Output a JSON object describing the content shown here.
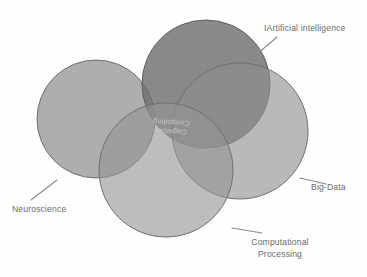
{
  "diagram": {
    "type": "venn",
    "background_color": "#fefefe",
    "stroke_color": "#6f6f6f",
    "label_color": "#6b6b6b",
    "center": {
      "label_line1": "Cognitive",
      "label_line2": "Computing",
      "fill": "#f7f7f7",
      "text_color": "#c9c9c9",
      "rotation_degrees": 183
    },
    "sets": [
      {
        "key": "artificial_intelligence",
        "label": "IArtificial intelligence",
        "fill": "#7d7d7d",
        "cx": 206,
        "cy": 84,
        "r": 64,
        "label_x": 264,
        "label_y": 31,
        "leader": {
          "x1": 250,
          "y1": 60,
          "x2": 277,
          "y2": 37
        }
      },
      {
        "key": "neuroscience",
        "label": "Neuroscience",
        "fill": "#9a9a9a",
        "cx": 96,
        "cy": 119,
        "r": 59,
        "label_x": 12,
        "label_y": 212,
        "leader": {
          "x1": 31,
          "y1": 200,
          "x2": 57,
          "y2": 180
        }
      },
      {
        "key": "big_data",
        "label": "Big-Data",
        "fill": "#8e8e8e",
        "cx": 240,
        "cy": 131,
        "r": 68,
        "label_x": 311,
        "label_y": 190,
        "leader": {
          "x1": 300,
          "y1": 178,
          "x2": 326,
          "y2": 184
        }
      },
      {
        "key": "computational_processing",
        "label_line1": "Computational",
        "label_line2": "Processing",
        "fill": "#949494",
        "cx": 166,
        "cy": 170,
        "r": 67,
        "label_x": 280,
        "label_y": 245,
        "leader": {
          "x1": 232,
          "y1": 228,
          "x2": 262,
          "y2": 233
        }
      }
    ]
  }
}
